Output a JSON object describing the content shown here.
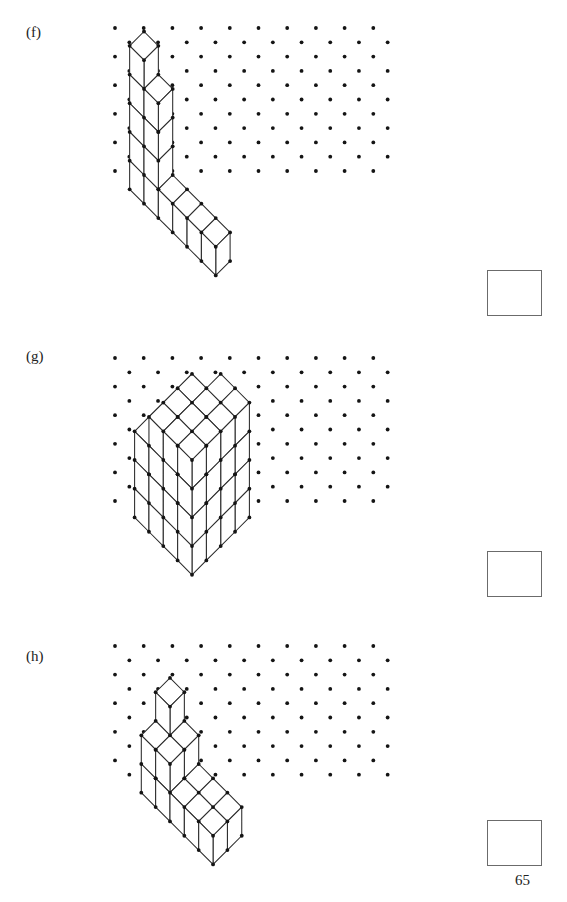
{
  "page": {
    "page_number": "65",
    "background": "#ffffff",
    "ink": "#1a1a1a",
    "width": 567,
    "height": 902
  },
  "grid": {
    "type": "isometric-dot-grid",
    "dot_radius": 1.9,
    "col_spacing": 28.7,
    "row_spacing": 28.6,
    "row_offset_y": 14.3,
    "col_offset_x": 14.35,
    "dot_color": "#141414",
    "cols": 10,
    "rows": 11
  },
  "cube_style": {
    "edge_color": "#2a2a2a",
    "edge_width": 1.05,
    "face_color": "#ffffff",
    "vertex_color": "#141414",
    "vertex_radius": 1.9,
    "cell_w": 28.7,
    "cell_h": 14.35,
    "cell_z": 28.7
  },
  "problems": [
    {
      "id": "f",
      "label": "(f)",
      "label_x": 26,
      "label_y": 32,
      "grid_origin_x": 115,
      "grid_origin_y": 27,
      "grid_cols": 10,
      "grid_rows": 11,
      "answer_box": {
        "x": 487,
        "y": 270,
        "label": ""
      },
      "shape_name": "L-shaped-solid",
      "description": "Vertical stack of 5 cubes with a step, joined at the base to a horizontal row of 5 cubes extending right.",
      "cubes": [
        {
          "x": 0,
          "y": 0,
          "z": 0
        },
        {
          "x": 0,
          "y": 0,
          "z": 1
        },
        {
          "x": 0,
          "y": 0,
          "z": 2
        },
        {
          "x": 0,
          "y": 0,
          "z": 3
        },
        {
          "x": 0,
          "y": 0,
          "z": 4
        },
        {
          "x": 1,
          "y": 0,
          "z": 0
        },
        {
          "x": 1,
          "y": 0,
          "z": 1
        },
        {
          "x": 1,
          "y": 0,
          "z": 2
        },
        {
          "x": 1,
          "y": 0,
          "z": 3
        },
        {
          "x": 2,
          "y": 0,
          "z": 0
        },
        {
          "x": 3,
          "y": 0,
          "z": 0
        },
        {
          "x": 4,
          "y": 0,
          "z": 0
        },
        {
          "x": 5,
          "y": 0,
          "z": 0
        }
      ],
      "cube_count": 13
    },
    {
      "id": "g",
      "label": "(g)",
      "label_x": 26,
      "label_y": 352,
      "grid_origin_x": 115,
      "grid_origin_y": 348,
      "grid_cols": 10,
      "grid_rows": 11,
      "answer_box": {
        "x": 487,
        "y": 551,
        "label": ""
      },
      "shape_name": "stepped-block-solid",
      "description": "A 4 wide by 4 deep by 4 high rectangular block with descending stair-steps cut on the front-left faces.",
      "cubes": [],
      "cube_count": 40
    },
    {
      "id": "h",
      "label": "(h)",
      "label_x": 26,
      "label_y": 656,
      "grid_origin_x": 115,
      "grid_origin_y": 641,
      "grid_cols": 10,
      "grid_rows": 10,
      "answer_box": {
        "x": 487,
        "y": 820,
        "label": ""
      },
      "shape_name": "pyramid-plus-arm-solid",
      "description": "A stepped pyramid of cubes rising to a single cube on top, with a flat arm of cubes extending to the right and down.",
      "cubes": [],
      "cube_count": 17
    }
  ]
}
